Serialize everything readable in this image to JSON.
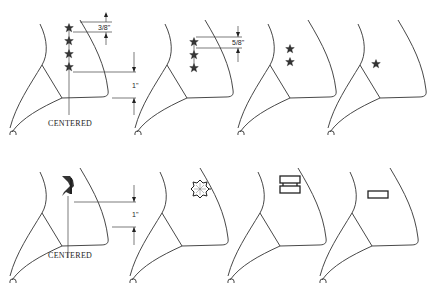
{
  "figure": {
    "rows": [
      {
        "panels": [
          {
            "insignia": "four-stars",
            "dimension_label": "3/8\"",
            "offset_label": "1\"",
            "caption": "CENTERED"
          },
          {
            "insignia": "three-stars",
            "dimension_label": "5/8\""
          },
          {
            "insignia": "two-stars"
          },
          {
            "insignia": "one-star"
          }
        ]
      },
      {
        "panels": [
          {
            "insignia": "eagle",
            "offset_label": "1\"",
            "caption": "CENTERED"
          },
          {
            "insignia": "oak-leaf"
          },
          {
            "insignia": "two-bars"
          },
          {
            "insignia": "one-bar"
          }
        ]
      }
    ]
  },
  "labels": {
    "dim_3_8": "3/8\"",
    "dim_5_8": "5/8\"",
    "dim_1_top": "1\"",
    "dim_1_bottom": "1\"",
    "centered_top": "CENTERED",
    "centered_bottom": "CENTERED"
  },
  "colors": {
    "line": "#333333",
    "background": "#ffffff"
  }
}
